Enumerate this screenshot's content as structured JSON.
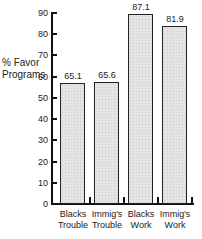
{
  "chart_data": {
    "type": "bar",
    "title": "",
    "xlabel": "",
    "ylabel": "% Favor Programs",
    "ylabel_lines": [
      "% Favor",
      "Programs"
    ],
    "ylim": [
      0,
      90
    ],
    "yticks": [
      0,
      10,
      20,
      30,
      40,
      50,
      60,
      70,
      80,
      90
    ],
    "grid": false,
    "legend": null,
    "categories": [
      "Blacks Trouble",
      "Immig's Trouble",
      "Blacks Work",
      "Immig's Work"
    ],
    "category_lines": [
      [
        "Blacks",
        "Trouble"
      ],
      [
        "Immig's",
        "Trouble"
      ],
      [
        "Blacks",
        "Work"
      ],
      [
        "Immig's",
        "Work"
      ]
    ],
    "values": [
      65.1,
      65.6,
      87.1,
      81.9
    ],
    "value_labels": [
      "65.1",
      "65.6",
      "87.1",
      "81.9"
    ],
    "drawn_heights": [
      57,
      57.5,
      89.5,
      84
    ]
  }
}
